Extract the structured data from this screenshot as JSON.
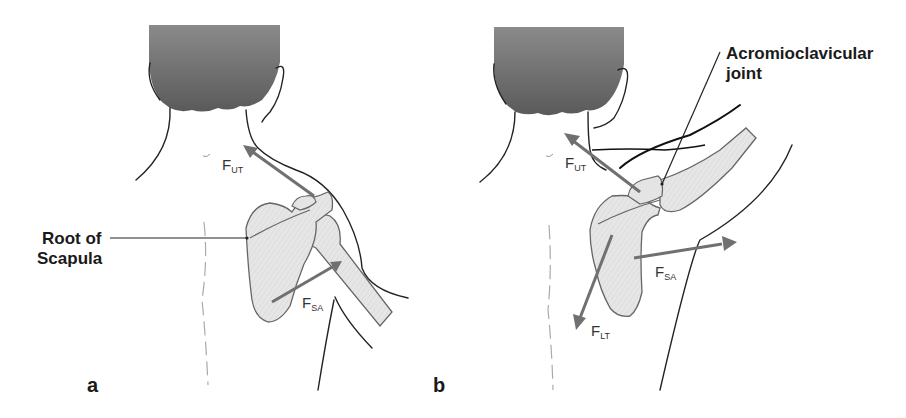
{
  "figure": {
    "panels": [
      {
        "id": "a",
        "panel_label": "a",
        "callout": {
          "line1": "Root of",
          "line2": "Scapula"
        },
        "forces": [
          {
            "symbol": "F",
            "subscript": "UT",
            "name": "upper trapezius force"
          },
          {
            "symbol": "F",
            "subscript": "SA",
            "name": "serratus anterior force"
          }
        ]
      },
      {
        "id": "b",
        "panel_label": "b",
        "callout": {
          "line1": "Acromioclavicular",
          "line2": "joint"
        },
        "forces": [
          {
            "symbol": "F",
            "subscript": "UT",
            "name": "upper trapezius force"
          },
          {
            "symbol": "F",
            "subscript": "SA",
            "name": "serratus anterior force"
          },
          {
            "symbol": "F",
            "subscript": "LT",
            "name": "lower trapezius force"
          }
        ]
      }
    ],
    "colors": {
      "hair": "#6e6e6e",
      "bone_fill": "#e4e4e4",
      "arrow": "#707070",
      "outline": "#222222"
    }
  }
}
